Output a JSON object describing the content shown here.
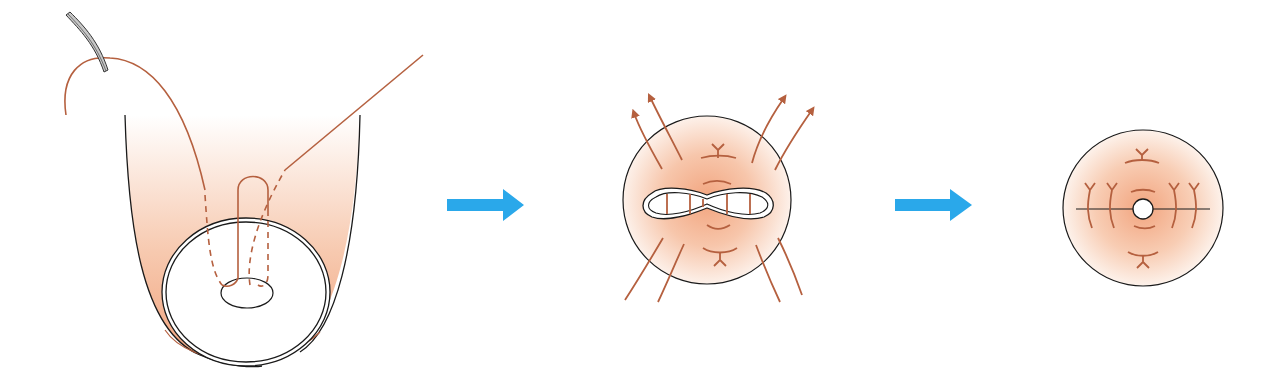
{
  "diagram": {
    "type": "procedure-sequence",
    "steps": [
      {
        "id": "step-1",
        "content": "suture-through-tissue-with-needle-and-ring"
      },
      {
        "id": "step-2",
        "content": "tissue-gathered-with-tension-arrows"
      },
      {
        "id": "step-3",
        "content": "closed-result-with-central-opening"
      }
    ],
    "arrows": [
      {
        "from": "step-1",
        "to": "step-2"
      },
      {
        "from": "step-2",
        "to": "step-3"
      }
    ],
    "colors": {
      "suture": "#b5603f",
      "outline": "#1a1a1a",
      "tissue_center": "#f2a47e",
      "tissue_edge": "#fdf1ea",
      "arrow": "#2aa8ea",
      "needle": "#c8c8c8"
    }
  }
}
